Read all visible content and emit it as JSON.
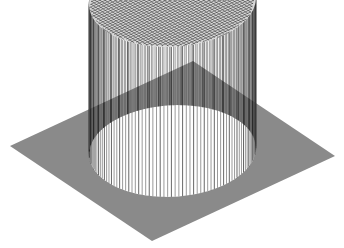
{
  "figure": {
    "background": "#ffffff",
    "line_color": "#000000"
  },
  "chart_data": {
    "type": "surface",
    "title": "",
    "xlabel": "",
    "ylabel": "",
    "zlabel": "",
    "axes_visible": false,
    "grid": "mesh wireframe",
    "function": "z = 1 inside circle of radius r, 0 outside (circ function)",
    "grid_size": [
      64,
      64
    ],
    "domain": {
      "x": [
        -1,
        1
      ],
      "y": [
        -1,
        1
      ]
    },
    "circle_radius": 0.72,
    "z_range": [
      0,
      1
    ],
    "plateau_value": 1,
    "base_value": 0,
    "view": "oblique isometric-like, base plane shown as rhombus"
  }
}
